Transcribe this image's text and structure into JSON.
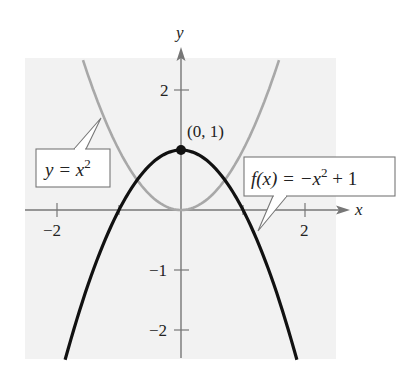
{
  "chart_data": {
    "type": "line",
    "title": "",
    "xlabel": "x",
    "ylabel": "y",
    "xlim": [
      -2.5,
      2.6
    ],
    "ylim": [
      -2.5,
      2.6
    ],
    "grid": false,
    "x_ticks": [
      {
        "value": -2,
        "label": "−2"
      },
      {
        "value": -1,
        "label": ""
      },
      {
        "value": 1,
        "label": ""
      },
      {
        "value": 2,
        "label": "2"
      }
    ],
    "y_ticks": [
      {
        "value": 2,
        "label": "2"
      },
      {
        "value": 1,
        "label": ""
      },
      {
        "value": -1,
        "label": "−1"
      },
      {
        "value": -2,
        "label": "−2"
      }
    ],
    "series": [
      {
        "name": "y = x^2",
        "label_parts": [
          "y = x",
          "2"
        ],
        "expression": "x^2",
        "color": "#a8a8a8",
        "x_range": [
          -1.58,
          1.58
        ]
      },
      {
        "name": "f(x) = -x^2 + 1",
        "label_parts": [
          "f(x) = −x",
          "2",
          " + 1"
        ],
        "expression": "-x^2+1",
        "color": "#111111",
        "x_range": [
          -1.87,
          1.87
        ]
      }
    ],
    "annotations": [
      {
        "label": "(0, 1)",
        "x": 0,
        "y": 1,
        "marker": "filled-circle"
      }
    ]
  },
  "labels": {
    "x_axis": "x",
    "y_axis": "y",
    "x_tick_neg2": "−2",
    "x_tick_2": "2",
    "y_tick_2": "2",
    "y_tick_neg1": "−1",
    "y_tick_neg2": "−2",
    "point": "(0, 1)",
    "gray_curve_main": "y = x",
    "gray_curve_exp": "2",
    "black_curve_main": "f(x) = −x",
    "black_curve_exp": "2",
    "black_curve_tail": " + 1"
  },
  "colors": {
    "plot_background": "#f2f2f2",
    "axes": "#777777",
    "gray_curve": "#a8a8a8",
    "black_curve": "#111111"
  }
}
